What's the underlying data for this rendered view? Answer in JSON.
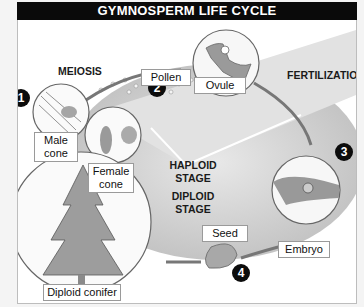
{
  "title": "GYMNOSPERM LIFE CYCLE",
  "stage_labels": {
    "meiosis": "MEIOSIS",
    "fertilization": "FERTILIZATION",
    "haploid": [
      "HAPLOID",
      "STAGE"
    ],
    "diploid": [
      "DIPLOID",
      "STAGE"
    ]
  },
  "steps": [
    "1",
    "2",
    "3",
    "4"
  ],
  "callouts": {
    "pollen": "Pollen",
    "ovule": "Ovule",
    "male_cone": [
      "Male",
      "cone"
    ],
    "female_cone": [
      "Female",
      "cone"
    ],
    "seed": "Seed",
    "embryo": "Embryo",
    "diploid_conifer": "Diploid conifer"
  },
  "colors": {
    "title_bg": "#0a0a0a",
    "ring": "#c9c9c9",
    "haploid_fill": "#dcdcdc",
    "tissue": "#8f8f8f"
  }
}
